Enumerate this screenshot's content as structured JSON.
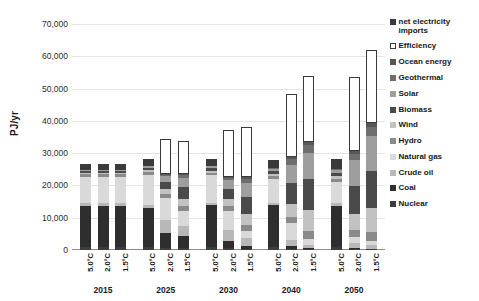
{
  "chart_data": {
    "type": "bar",
    "stacked": true,
    "title": "",
    "xlabel": "",
    "ylabel": "PJ/yr",
    "ylim": [
      0,
      70000
    ],
    "ytick_labels": [
      "70,000",
      "60,000",
      "50,000",
      "40,000",
      "30,000",
      "20,000",
      "10,000",
      "0"
    ],
    "ytick_values": [
      70000,
      60000,
      50000,
      40000,
      30000,
      20000,
      10000,
      0
    ],
    "grid": true,
    "legend_position": "right",
    "group_labels": [
      "2015",
      "2025",
      "2030",
      "2040",
      "2050"
    ],
    "scenario_labels": [
      "5.0°C",
      "2.0°C",
      "1.5°C"
    ],
    "categories": [
      "2015 5.0°C",
      "2015 2.0°C",
      "2015 1.5°C",
      "2025 5.0°C",
      "2025 2.0°C",
      "2025 1.5°C",
      "2030 5.0°C",
      "2030 2.0°C",
      "2030 1.5°C",
      "2040 5.0°C",
      "2040 2.0°C",
      "2040 1.5°C",
      "2050 5.0°C",
      "2050 2.0°C",
      "2050 1.5°C"
    ],
    "series": [
      {
        "name": "Nuclear",
        "color": "#3d3d3d",
        "values": [
          900,
          900,
          900,
          900,
          700,
          600,
          900,
          500,
          400,
          900,
          300,
          200,
          900,
          200,
          200
        ]
      },
      {
        "name": "Coal",
        "color": "#2e2e2e",
        "values": [
          12700,
          12700,
          12700,
          12200,
          4600,
          3600,
          12900,
          2300,
          900,
          12900,
          900,
          300,
          12700,
          400,
          200
        ]
      },
      {
        "name": "Crude oil",
        "color": "#b8b8b8",
        "values": [
          1000,
          1000,
          1000,
          1000,
          3900,
          3100,
          900,
          3500,
          2400,
          900,
          1900,
          1100,
          900,
          1600,
          1300
        ]
      },
      {
        "name": "Natural gas",
        "color": "#d9d9d9",
        "values": [
          8100,
          8100,
          8100,
          9300,
          6800,
          4700,
          8400,
          5800,
          2100,
          7200,
          5300,
          1700,
          6700,
          1800,
          1200
        ]
      },
      {
        "name": "Hydro",
        "color": "#8a8a8a",
        "values": [
          900,
          900,
          900,
          900,
          1300,
          1600,
          900,
          1500,
          1900,
          900,
          1900,
          2600,
          900,
          2300,
          2700
        ]
      },
      {
        "name": "Wind",
        "color": "#c2c2c2",
        "values": [
          300,
          300,
          300,
          500,
          1500,
          2300,
          600,
          2100,
          3400,
          700,
          4100,
          6500,
          800,
          5000,
          7400
        ]
      },
      {
        "name": "Biomass",
        "color": "#4a4a4a",
        "values": [
          600,
          600,
          600,
          700,
          2300,
          3600,
          800,
          3300,
          5400,
          900,
          6400,
          9500,
          1000,
          8600,
          11500
        ]
      },
      {
        "name": "Solar",
        "color": "#9e9e9e",
        "values": [
          200,
          200,
          200,
          400,
          1800,
          2900,
          500,
          2700,
          4400,
          700,
          5700,
          8300,
          800,
          7900,
          10800
        ]
      },
      {
        "name": "Geothermal",
        "color": "#6e6e6e",
        "values": [
          100,
          100,
          100,
          200,
          500,
          800,
          200,
          700,
          1200,
          300,
          1600,
          2300,
          300,
          2100,
          2900
        ]
      },
      {
        "name": "Ocean energy",
        "color": "#575757",
        "values": [
          50,
          50,
          50,
          100,
          200,
          300,
          100,
          300,
          500,
          100,
          600,
          900,
          200,
          900,
          1200
        ]
      },
      {
        "name": "Efficiency",
        "color": "#ffffff",
        "values": [
          0,
          0,
          0,
          0,
          10900,
          10200,
          0,
          14600,
          15600,
          0,
          19700,
          20400,
          0,
          22900,
          22500
        ]
      },
      {
        "name": "net electricity imports",
        "color": "#3a3a3a",
        "values": [
          1700,
          1700,
          1700,
          2000,
          0,
          0,
          2100,
          0,
          0,
          2500,
          0,
          0,
          3000,
          0,
          0
        ]
      }
    ],
    "totals": [
      26550,
      26550,
      26550,
      28200,
      34500,
      33700,
      28300,
      37300,
      38200,
      28000,
      48400,
      53800,
      28200,
      53700,
      61900
    ]
  },
  "legend": {
    "items": [
      {
        "label": "net electricity imports",
        "swatch": "filled"
      },
      {
        "label": "Efficiency",
        "swatch": "outline"
      },
      {
        "label": "Ocean energy",
        "swatch": "filled"
      },
      {
        "label": "Geothermal",
        "swatch": "filled"
      },
      {
        "label": "Solar",
        "swatch": "filled"
      },
      {
        "label": "Biomass",
        "swatch": "filled"
      },
      {
        "label": "Wind",
        "swatch": "filled"
      },
      {
        "label": "Hydro",
        "swatch": "filled"
      },
      {
        "label": "Natural gas",
        "swatch": "filled"
      },
      {
        "label": "Crude oil",
        "swatch": "filled"
      },
      {
        "label": "Coal",
        "swatch": "filled"
      },
      {
        "label": "Nuclear",
        "swatch": "filled"
      }
    ]
  }
}
